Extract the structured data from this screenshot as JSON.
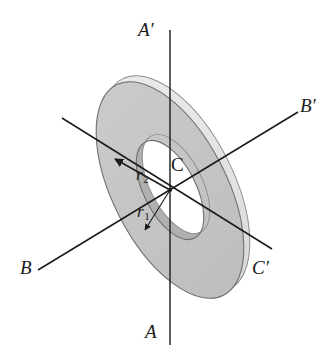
{
  "figure": {
    "kind": "annular-disk-rotation-axes-diagram",
    "background_color": "#ffffff",
    "disk_face_color": "#c6c6c6",
    "disk_rim_color": "#e4e4e4",
    "disk_inner_wall_color": "#a9a9a9",
    "outline_color": "#555555",
    "axis_line_color": "#1a1a1a",
    "text_color": "#1a1a1a"
  },
  "labels": {
    "axis_a_top": "A′",
    "axis_a_bottom": "A",
    "axis_b_left": "B",
    "axis_b_right": "B′",
    "axis_c_right": "C′",
    "center_point": "C",
    "radius_outer": "r",
    "radius_outer_sub": "2",
    "radius_inner": "r",
    "radius_inner_sub": "1"
  },
  "geometry": {
    "center_x": 170,
    "center_y": 190,
    "outer_rx": 57,
    "outer_ry": 118,
    "inner_rx": 26,
    "inner_ry": 54,
    "tilt_degrees": -27,
    "axis_a_x": 170,
    "axis_a_top_y": 30,
    "axis_a_bottom_y": 345,
    "axis_b_start": [
      38,
      270
    ],
    "axis_b_end": [
      298,
      112
    ],
    "axis_c_start": [
      62,
      118
    ],
    "axis_c_end": [
      272,
      249
    ],
    "r2_arrow_tip": [
      113,
      157
    ],
    "r1_arrow_tip": [
      143,
      232
    ]
  }
}
